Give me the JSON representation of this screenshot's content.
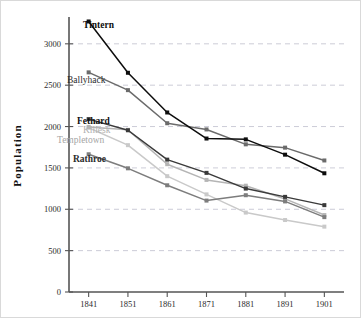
{
  "chart_data": {
    "type": "line",
    "title": "",
    "xlabel": "",
    "ylabel": "Population",
    "categories": [
      "1841",
      "1851",
      "1861",
      "1871",
      "1881",
      "1891",
      "1901"
    ],
    "x": [
      1841,
      1851,
      1861,
      1871,
      1881,
      1891,
      1901
    ],
    "xlim": [
      1836,
      1906
    ],
    "ylim": [
      0,
      3300
    ],
    "yticks": [
      0,
      500,
      1000,
      1500,
      2000,
      2500,
      3000
    ],
    "ytick_labels": [
      "0",
      "500",
      "1000",
      "1500",
      "2000",
      "2500",
      "3000"
    ],
    "grid": "horizontal-dashed",
    "legend": "inline-left-labels",
    "series": [
      {
        "name": "Tintern",
        "color": "#0d0d0d",
        "label_style": "bold",
        "values": [
          3270,
          2650,
          2170,
          1855,
          1845,
          1660,
          1435
        ]
      },
      {
        "name": "Ballyhack",
        "color": "#6b6b6b",
        "label_style": "normal",
        "values": [
          2655,
          2440,
          2040,
          1965,
          1785,
          1745,
          1590
        ]
      },
      {
        "name": "Fethard",
        "color": "#3a3a3a",
        "label_style": "bold",
        "values": [
          2090,
          1955,
          1600,
          1440,
          1250,
          1150,
          1050
        ]
      },
      {
        "name": "Killesk",
        "color": "#b5b5b5",
        "label_style": "light",
        "values": [
          1995,
          1960,
          1545,
          1355,
          1285,
          1125,
          930
        ]
      },
      {
        "name": "Templetown",
        "color": "#c9c9c9",
        "label_style": "light",
        "values": [
          1985,
          1775,
          1400,
          1180,
          960,
          870,
          790
        ]
      },
      {
        "name": "Rathroe",
        "color": "#7d7d7d",
        "label_style": "bold",
        "values": [
          1665,
          1495,
          1290,
          1105,
          1170,
          1095,
          905
        ]
      }
    ],
    "series_labels": [
      {
        "name": "Tintern",
        "x": 82,
        "y": 27,
        "anchor": "start",
        "weight": "bold",
        "fill": "#0d0d0d"
      },
      {
        "name": "Ballyhack",
        "x": 66,
        "y": 82,
        "anchor": "start",
        "weight": "normal",
        "fill": "#2b2b2b"
      },
      {
        "name": "Fethard",
        "x": 76,
        "y": 123,
        "anchor": "start",
        "weight": "bold",
        "fill": "#111111"
      },
      {
        "name": "Killesk",
        "x": 82,
        "y": 132,
        "anchor": "start",
        "weight": "normal",
        "fill": "#b0b0b0"
      },
      {
        "name": "Templetown",
        "x": 56,
        "y": 142,
        "anchor": "start",
        "weight": "normal",
        "fill": "#a5a5a5"
      },
      {
        "name": "Rathroe",
        "x": 72,
        "y": 161,
        "anchor": "start",
        "weight": "bold",
        "fill": "#2b2b2b"
      }
    ],
    "colors": {
      "background": "#ffffff",
      "frame": "#d9d9d9",
      "axis": "#555555",
      "gridline": "#c6c6d2",
      "text": "#2b2b2b"
    }
  }
}
